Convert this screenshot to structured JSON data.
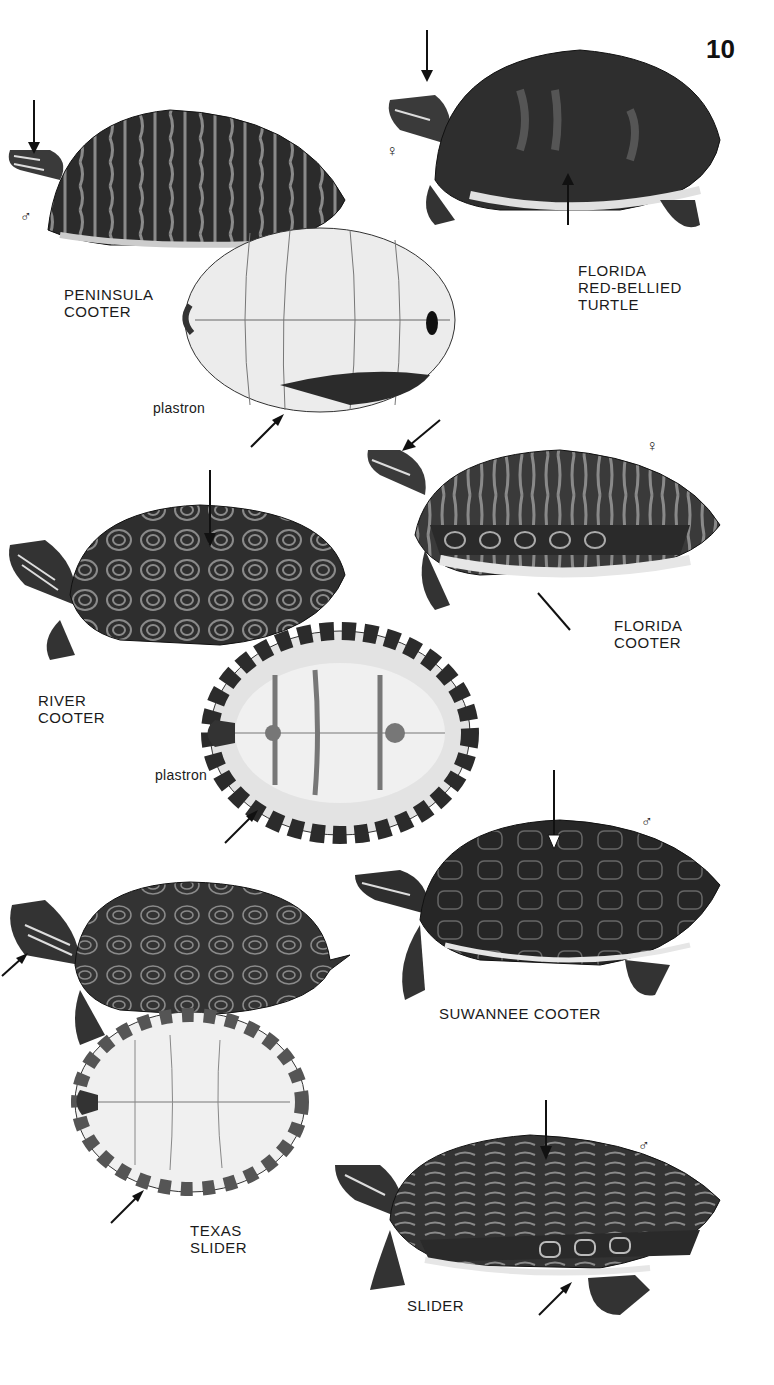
{
  "page": {
    "number": "10",
    "background": "#ffffff"
  },
  "species": [
    {
      "name_line1": "PENINSULA",
      "name_line2": "COOTER",
      "sex": "♂",
      "plastron_label": "plastron"
    },
    {
      "name_line1": "FLORIDA",
      "name_line2": "RED-BELLIED",
      "name_line3": "TURTLE",
      "sex": "♀"
    },
    {
      "name_line1": "FLORIDA",
      "name_line2": "COOTER",
      "sex": "♀"
    },
    {
      "name_line1": "RIVER",
      "name_line2": "COOTER",
      "plastron_label": "plastron"
    },
    {
      "name_line1": "SUWANNEE COOTER",
      "sex": "♂"
    },
    {
      "name_line1": "TEXAS",
      "name_line2": "SLIDER"
    },
    {
      "name_line1": "SLIDER",
      "sex": "♂"
    }
  ],
  "colors": {
    "shell_dark": "#2b2b2b",
    "shell_mid": "#4a4a4a",
    "pattern": "#8a8a8a",
    "plastron": "#ececec",
    "arrow": "#111111"
  }
}
